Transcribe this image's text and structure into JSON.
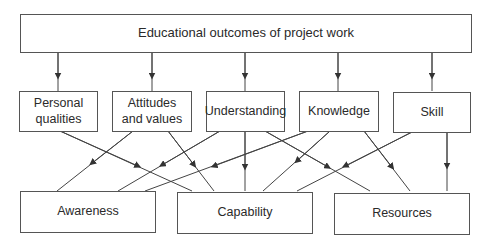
{
  "diagram": {
    "title": "Educational outcomes of project work",
    "middle": [
      {
        "id": "personal",
        "label": "Personal\nqualities"
      },
      {
        "id": "attitudes",
        "label": "Attitudes\nand values"
      },
      {
        "id": "understanding",
        "label": "Understanding"
      },
      {
        "id": "knowledge",
        "label": "Knowledge"
      },
      {
        "id": "skill",
        "label": "Skill"
      }
    ],
    "bottom": [
      {
        "id": "awareness",
        "label": "Awareness"
      },
      {
        "id": "capability",
        "label": "Capability"
      },
      {
        "id": "resources",
        "label": "Resources"
      }
    ],
    "edges": [
      {
        "from": "title",
        "to": "personal"
      },
      {
        "from": "title",
        "to": "attitudes"
      },
      {
        "from": "title",
        "to": "understanding"
      },
      {
        "from": "title",
        "to": "knowledge"
      },
      {
        "from": "title",
        "to": "skill"
      },
      {
        "from": "personal",
        "to": "capability"
      },
      {
        "from": "attitudes",
        "to": "awareness"
      },
      {
        "from": "attitudes",
        "to": "capability"
      },
      {
        "from": "understanding",
        "to": "awareness"
      },
      {
        "from": "understanding",
        "to": "capability"
      },
      {
        "from": "understanding",
        "to": "resources"
      },
      {
        "from": "knowledge",
        "to": "awareness"
      },
      {
        "from": "knowledge",
        "to": "capability"
      },
      {
        "from": "knowledge",
        "to": "resources"
      },
      {
        "from": "skill",
        "to": "capability"
      },
      {
        "from": "skill",
        "to": "resources"
      }
    ],
    "colors": {
      "line": "#444444",
      "border": "#555555",
      "text": "#2a2a2a"
    }
  }
}
